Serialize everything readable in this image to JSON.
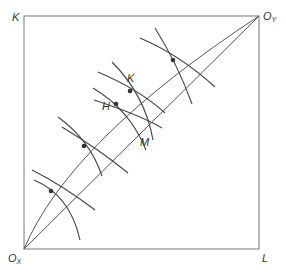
{
  "diagram": {
    "type": "edgeworth-box",
    "colors": {
      "line": "#555555",
      "dot": "#333333",
      "text": "#333333",
      "background": "#ffffff"
    },
    "labels": {
      "top_left": "K",
      "top_right": "O",
      "top_right_sub": "Y",
      "bottom_left": "O",
      "bottom_left_sub": "X",
      "bottom_right": "L",
      "point_h": "H",
      "point_k": "K",
      "point_m": "M"
    },
    "contract_curve_points": [
      {
        "x": 51,
        "y": 191
      },
      {
        "x": 84,
        "y": 146
      },
      {
        "x": 116,
        "y": 104,
        "label": "H"
      },
      {
        "x": 130,
        "y": 91,
        "label": "K"
      },
      {
        "x": 173,
        "y": 60
      }
    ],
    "diagonal_point": {
      "label": "M"
    }
  }
}
